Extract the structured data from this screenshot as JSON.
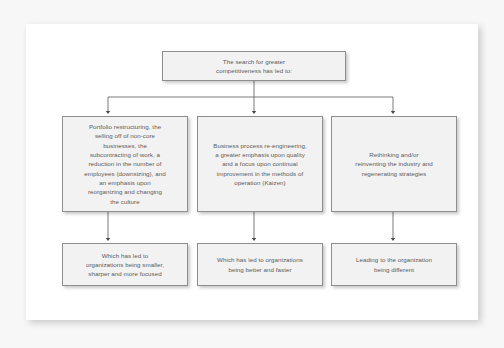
{
  "diagram": {
    "type": "flowchart",
    "orientation": "top-down",
    "levels": 3,
    "top": {
      "id": "box-top",
      "lines": [
        "The search for greater",
        "competitiveness has led to:"
      ]
    },
    "middle": [
      {
        "id": "box-mid-1",
        "lines": [
          "Portfolio restructuring, the",
          "selling off of non-core",
          "businesses, the",
          "subcontracting of work, a",
          "reduction in the number of",
          "employees (downsizing), and",
          "an emphasis upon",
          "reorganizing and changing",
          "the culture"
        ]
      },
      {
        "id": "box-mid-2",
        "lines": [
          "Business process re-engineering,",
          "a greater emphasis upon quality",
          "and a focus upon continual",
          "improvement in the methods of",
          "operation (Kaizen)"
        ]
      },
      {
        "id": "box-mid-3",
        "lines": [
          "Rethinking and/or",
          "reinventing the industry and",
          "regenerating strategies"
        ]
      }
    ],
    "bottom": [
      {
        "id": "box-bot-1",
        "lines": [
          "Which has led to",
          "organizations being smaller,",
          "sharper and more focused"
        ]
      },
      {
        "id": "box-bot-2",
        "lines": [
          "Which has led to organizations",
          "being better and faster"
        ]
      },
      {
        "id": "box-bot-3",
        "lines": [
          "Leading to the organization",
          "being different"
        ]
      }
    ],
    "colors": {
      "box_fill": "#f2f2f2",
      "box_border": "#8e8e8e",
      "text": "#5b5b5b",
      "connector": "#6b6b6b",
      "panel": "#ffffff",
      "mat": "#f7f7f7"
    }
  }
}
